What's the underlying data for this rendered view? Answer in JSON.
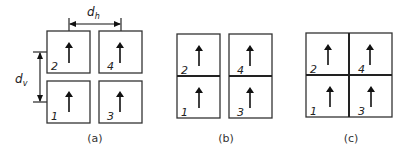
{
  "figure": {
    "panels": [
      {
        "caption": "(a)",
        "layout": "separated 2x2 grid",
        "cells": [
          {
            "id": "1",
            "position": "bottom-left",
            "arrow": "up"
          },
          {
            "id": "2",
            "position": "top-left",
            "arrow": "up"
          },
          {
            "id": "3",
            "position": "bottom-right",
            "arrow": "up"
          },
          {
            "id": "4",
            "position": "top-right",
            "arrow": "up"
          }
        ],
        "dimensions": {
          "horizontal": {
            "symbol": "d",
            "subscript": "h"
          },
          "vertical": {
            "symbol": "d",
            "subscript": "v"
          }
        }
      },
      {
        "caption": "(b)",
        "layout": "two vertical pairs joined",
        "cells": [
          {
            "id": "1",
            "position": "bottom-left",
            "arrow": "up"
          },
          {
            "id": "2",
            "position": "top-left",
            "arrow": "up"
          },
          {
            "id": "3",
            "position": "bottom-right",
            "arrow": "up"
          },
          {
            "id": "4",
            "position": "top-right",
            "arrow": "up"
          }
        ]
      },
      {
        "caption": "(c)",
        "layout": "fully joined 2x2 block",
        "cells": [
          {
            "id": "1",
            "position": "bottom-left",
            "arrow": "up"
          },
          {
            "id": "2",
            "position": "top-left",
            "arrow": "up"
          },
          {
            "id": "3",
            "position": "bottom-right",
            "arrow": "up"
          },
          {
            "id": "4",
            "position": "top-right",
            "arrow": "up"
          }
        ]
      }
    ]
  }
}
